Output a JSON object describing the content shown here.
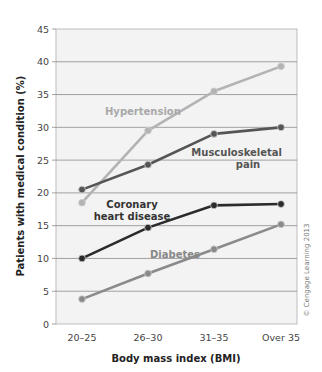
{
  "chart_data": {
    "type": "line",
    "title": "",
    "xlabel": "Body mass index (BMI)",
    "ylabel": "Patients with medical condition (%)",
    "categories": [
      "20–25",
      "26–30",
      "31–35",
      "Over 35"
    ],
    "ylim": [
      0,
      45
    ],
    "yticks": [
      0,
      5,
      10,
      15,
      20,
      25,
      30,
      35,
      40,
      45
    ],
    "grid": true,
    "legend_position": "inline labels",
    "series": [
      {
        "name": "Hypertension",
        "values": [
          18.5,
          29.5,
          35.5,
          39.3
        ],
        "color": "#b3b3b3"
      },
      {
        "name": "Musculoskeletal pain",
        "values": [
          20.5,
          24.3,
          29.0,
          30.0
        ],
        "color": "#555555"
      },
      {
        "name": "Coronary heart disease",
        "values": [
          10.0,
          14.7,
          18.1,
          18.3
        ],
        "color": "#2b2b2b"
      },
      {
        "name": "Diabetes",
        "values": [
          3.8,
          7.7,
          11.4,
          15.2
        ],
        "color": "#8a8a8a"
      }
    ],
    "annotations": {
      "hypertension": "Hypertension",
      "musculo_line1": "Musculoskeletal",
      "musculo_line2": "pain",
      "coronary_line1": "Coronary",
      "coronary_line2": "heart disease",
      "diabetes": "Diabetes",
      "credit": "© Cengage Learning 2013"
    }
  }
}
